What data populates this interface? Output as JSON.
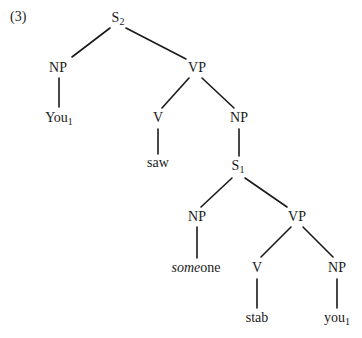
{
  "example_label": "(3)",
  "nodes": {
    "s2": {
      "label": "S",
      "sub": "2",
      "x": 118,
      "y": 18
    },
    "np1": {
      "label": "NP",
      "sub": "",
      "x": 58,
      "y": 68
    },
    "vp1": {
      "label": "VP",
      "sub": "",
      "x": 197,
      "y": 68
    },
    "you1": {
      "label": "You",
      "sub": "1",
      "x": 59,
      "y": 118
    },
    "v1": {
      "label": "V",
      "sub": "",
      "x": 158,
      "y": 118
    },
    "np2": {
      "label": "NP",
      "sub": "",
      "x": 239,
      "y": 118
    },
    "saw": {
      "label": "saw",
      "sub": "",
      "x": 158,
      "y": 163
    },
    "s1": {
      "label": "S",
      "sub": "1",
      "x": 238,
      "y": 166
    },
    "np3": {
      "label": "NP",
      "sub": "",
      "x": 197,
      "y": 217
    },
    "vp2": {
      "label": "VP",
      "sub": "",
      "x": 297,
      "y": 217
    },
    "someone": {
      "label_italic": "some",
      "label_rest": "one",
      "x": 196,
      "y": 268
    },
    "v2": {
      "label": "V",
      "sub": "",
      "x": 257,
      "y": 268
    },
    "np4": {
      "label": "NP",
      "sub": "",
      "x": 337,
      "y": 268
    },
    "stab": {
      "label": "stab",
      "sub": "",
      "x": 257,
      "y": 318
    },
    "you1b": {
      "label": "you",
      "sub": "1",
      "x": 337,
      "y": 318
    }
  },
  "edges": [
    {
      "from": "s2",
      "to": "np1",
      "x1": 110,
      "y1": 28,
      "x2": 72,
      "y2": 57
    },
    {
      "from": "s2",
      "to": "vp1",
      "x1": 126,
      "y1": 28,
      "x2": 186,
      "y2": 59
    },
    {
      "from": "np1",
      "to": "you1",
      "x1": 59,
      "y1": 78,
      "x2": 59,
      "y2": 107
    },
    {
      "from": "vp1",
      "to": "v1",
      "x1": 189,
      "y1": 78,
      "x2": 162,
      "y2": 108
    },
    {
      "from": "vp1",
      "to": "np2",
      "x1": 202,
      "y1": 78,
      "x2": 234,
      "y2": 108
    },
    {
      "from": "v1",
      "to": "saw",
      "x1": 158,
      "y1": 129,
      "x2": 158,
      "y2": 154
    },
    {
      "from": "np2",
      "to": "s1",
      "x1": 239,
      "y1": 129,
      "x2": 239,
      "y2": 156
    },
    {
      "from": "s1",
      "to": "np3",
      "x1": 232,
      "y1": 178,
      "x2": 201,
      "y2": 207
    },
    {
      "from": "s1",
      "to": "vp2",
      "x1": 245,
      "y1": 178,
      "x2": 287,
      "y2": 207
    },
    {
      "from": "np3",
      "to": "someone",
      "x1": 197,
      "y1": 227,
      "x2": 197,
      "y2": 258
    },
    {
      "from": "vp2",
      "to": "v2",
      "x1": 291,
      "y1": 227,
      "x2": 261,
      "y2": 257
    },
    {
      "from": "vp2",
      "to": "np4",
      "x1": 303,
      "y1": 227,
      "x2": 333,
      "y2": 257
    },
    {
      "from": "v2",
      "to": "stab",
      "x1": 257,
      "y1": 279,
      "x2": 257,
      "y2": 308
    },
    {
      "from": "np4",
      "to": "you1b",
      "x1": 337,
      "y1": 279,
      "x2": 337,
      "y2": 308
    }
  ]
}
